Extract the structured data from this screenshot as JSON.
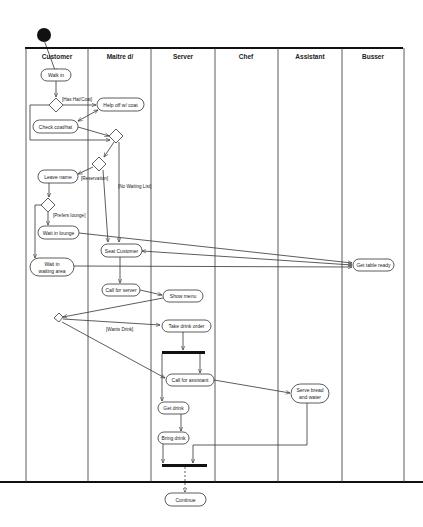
{
  "diagram": {
    "type": "uml-activity-diagram",
    "lanes": [
      {
        "id": "customer",
        "label": "Customer"
      },
      {
        "id": "maitre",
        "label": "Maitre d/"
      },
      {
        "id": "server",
        "label": "Server"
      },
      {
        "id": "chef",
        "label": "Chef"
      },
      {
        "id": "assistant",
        "label": "Assistant"
      },
      {
        "id": "busser",
        "label": "Busser"
      }
    ],
    "nodes": {
      "walk_in": "Walk in",
      "help_off_coat": "Help off w/ coat",
      "check_coat": "Check coat/hat",
      "leave_name": "Leave name",
      "wait_lounge": "Wait in lounge",
      "wait_area_1": "Wait in",
      "wait_area_2": "waiting area",
      "seat_customer": "Seat Customer",
      "get_table_ready": "Get table ready",
      "call_server": "Call for server",
      "show_menu": "Show menu",
      "take_drink_order": "Take drink order",
      "call_assistant": "Call for assistant",
      "serve_bread_1": "Serve bread",
      "serve_bread_2": "and water",
      "get_drink": "Get drink",
      "bring_drink": "Bring drink",
      "continue": "Continue"
    },
    "guards": {
      "has_hat_coat": "[Has Hat/Coat]",
      "reservation": "[Reservation]",
      "no_waiting_list": "[No Waiting List]",
      "prefers_lounge": "[Prefers lounge]",
      "wants_drink": "[Wants Drink]"
    }
  }
}
